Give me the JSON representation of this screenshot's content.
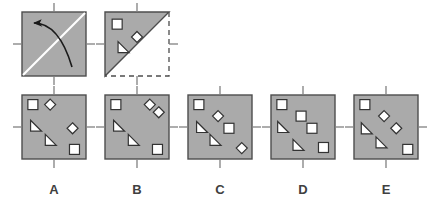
{
  "figure": {
    "type": "paper-folding-puzzle",
    "title": "",
    "colors": {
      "paper_fill": "#aaaaaa",
      "paper_stroke": "#4d4d4d",
      "shape_fill": "#ffffff",
      "shape_stroke": "#333333",
      "tick_stroke": "#808080",
      "fold_line": "#ffffff",
      "arrow": "#1a1a1a",
      "dashed": "#4d4d4d",
      "label_text": "#404040",
      "background": "#ffffff"
    },
    "prompt_row": {
      "panels": [
        {
          "name": "fold-instruction-panel",
          "x": 22,
          "y": 12,
          "size": 64,
          "kind": "square-with-fold-arrow",
          "fold_line": "diagonal-bottom-left-to-top-right",
          "arrow": "curved-arrow-pointing-upper-left",
          "shapes": []
        },
        {
          "name": "folded-state-panel",
          "x": 105,
          "y": 12,
          "size": 64,
          "kind": "upper-left-triangle-with-shapes",
          "dashed_outline": "right-and-bottom-of-unfolded-square",
          "shapes": [
            {
              "type": "square",
              "cx": 0.19,
              "cy": 0.19,
              "size": 10
            },
            {
              "type": "diamond",
              "cx": 0.5,
              "cy": 0.39,
              "size": 11
            },
            {
              "type": "triangle",
              "cx": 0.29,
              "cy": 0.55,
              "size": 11
            }
          ]
        }
      ]
    },
    "options_row": {
      "y": 95,
      "size": 64,
      "label_y": 194,
      "options": [
        {
          "label": "A",
          "name": "option-a",
          "x": 22,
          "shapes": [
            {
              "type": "square",
              "cx": 0.17,
              "cy": 0.15,
              "size": 10
            },
            {
              "type": "diamond",
              "cx": 0.44,
              "cy": 0.15,
              "size": 11
            },
            {
              "type": "triangle",
              "cx": 0.22,
              "cy": 0.48,
              "size": 11
            },
            {
              "type": "diamond",
              "cx": 0.79,
              "cy": 0.52,
              "size": 11
            },
            {
              "type": "triangle",
              "cx": 0.45,
              "cy": 0.7,
              "size": 11
            },
            {
              "type": "square",
              "cx": 0.82,
              "cy": 0.85,
              "size": 10
            }
          ]
        },
        {
          "label": "B",
          "name": "option-b",
          "x": 105,
          "shapes": [
            {
              "type": "square",
              "cx": 0.17,
              "cy": 0.15,
              "size": 10
            },
            {
              "type": "diamond",
              "cx": 0.7,
              "cy": 0.15,
              "size": 11
            },
            {
              "type": "diamond",
              "cx": 0.84,
              "cy": 0.27,
              "size": 11
            },
            {
              "type": "triangle",
              "cx": 0.22,
              "cy": 0.48,
              "size": 11
            },
            {
              "type": "triangle",
              "cx": 0.45,
              "cy": 0.7,
              "size": 11
            },
            {
              "type": "square",
              "cx": 0.82,
              "cy": 0.85,
              "size": 10
            }
          ]
        },
        {
          "label": "C",
          "name": "option-c",
          "x": 188,
          "shapes": [
            {
              "type": "square",
              "cx": 0.17,
              "cy": 0.15,
              "size": 10
            },
            {
              "type": "diamond",
              "cx": 0.47,
              "cy": 0.33,
              "size": 11
            },
            {
              "type": "triangle",
              "cx": 0.22,
              "cy": 0.5,
              "size": 11
            },
            {
              "type": "square",
              "cx": 0.64,
              "cy": 0.52,
              "size": 10
            },
            {
              "type": "triangle",
              "cx": 0.43,
              "cy": 0.7,
              "size": 11
            },
            {
              "type": "diamond",
              "cx": 0.84,
              "cy": 0.83,
              "size": 11
            }
          ]
        },
        {
          "label": "D",
          "name": "option-d",
          "x": 271,
          "shapes": [
            {
              "type": "square",
              "cx": 0.17,
              "cy": 0.15,
              "size": 10
            },
            {
              "type": "square",
              "cx": 0.47,
              "cy": 0.33,
              "size": 10
            },
            {
              "type": "triangle",
              "cx": 0.19,
              "cy": 0.5,
              "size": 11
            },
            {
              "type": "square",
              "cx": 0.64,
              "cy": 0.52,
              "size": 10
            },
            {
              "type": "triangle",
              "cx": 0.43,
              "cy": 0.78,
              "size": 11
            },
            {
              "type": "square",
              "cx": 0.82,
              "cy": 0.82,
              "size": 10
            }
          ]
        },
        {
          "label": "E",
          "name": "option-e",
          "x": 354,
          "shapes": [
            {
              "type": "square",
              "cx": 0.17,
              "cy": 0.15,
              "size": 10
            },
            {
              "type": "diamond",
              "cx": 0.47,
              "cy": 0.33,
              "size": 11
            },
            {
              "type": "triangle",
              "cx": 0.2,
              "cy": 0.52,
              "size": 11
            },
            {
              "type": "diamond",
              "cx": 0.66,
              "cy": 0.52,
              "size": 11
            },
            {
              "type": "triangle",
              "cx": 0.43,
              "cy": 0.74,
              "size": 11
            },
            {
              "type": "square",
              "cx": 0.84,
              "cy": 0.85,
              "size": 10
            }
          ]
        }
      ]
    },
    "tick_marks": {
      "name": "edge-tick-marks",
      "length": 9,
      "sides": [
        "top",
        "right",
        "bottom",
        "left"
      ],
      "position": "midpoint-of-each-edge"
    }
  }
}
